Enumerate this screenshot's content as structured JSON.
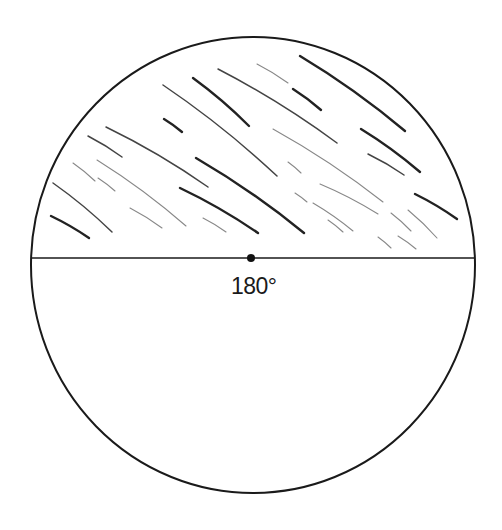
{
  "diagram": {
    "title": "",
    "angle_label": "180°",
    "colors": {
      "background": "#ffffff",
      "stroke": "#1a1a1a",
      "hatch_dark": "#222222",
      "hatch_mid": "#444444",
      "hatch_light": "#888888"
    },
    "circle": {
      "cx": 253,
      "cy": 265,
      "rx": 222,
      "ry": 228
    },
    "diameter": {
      "x1": 31,
      "x2": 474,
      "y": 258
    },
    "center_point": {
      "x": 251,
      "y": 258,
      "r": 4
    },
    "shaded_region": "upper semicircle (hatched)",
    "hatch_lines": [
      [
        300,
        56,
        405,
        131,
        "d"
      ],
      [
        257,
        64,
        288,
        83,
        "l"
      ],
      [
        293,
        89,
        321,
        110,
        "d"
      ],
      [
        218,
        69,
        337,
        143,
        "m"
      ],
      [
        193,
        78,
        249,
        126,
        "d"
      ],
      [
        163,
        85,
        277,
        176,
        "m"
      ],
      [
        164,
        119,
        182,
        132,
        "d"
      ],
      [
        273,
        129,
        383,
        202,
        "l"
      ],
      [
        361,
        129,
        420,
        172,
        "d"
      ],
      [
        368,
        154,
        404,
        175,
        "m"
      ],
      [
        106,
        127,
        208,
        187,
        "m"
      ],
      [
        88,
        136,
        122,
        157,
        "m"
      ],
      [
        73,
        163,
        95,
        181,
        "l"
      ],
      [
        97,
        160,
        186,
        226,
        "l"
      ],
      [
        98,
        178,
        115,
        191,
        "l"
      ],
      [
        53,
        183,
        112,
        232,
        "m"
      ],
      [
        51,
        216,
        89,
        238,
        "d"
      ],
      [
        130,
        208,
        162,
        228,
        "l"
      ],
      [
        180,
        188,
        258,
        233,
        "d"
      ],
      [
        196,
        158,
        304,
        233,
        "d"
      ],
      [
        203,
        218,
        226,
        232,
        "l"
      ],
      [
        288,
        162,
        301,
        173,
        "l"
      ],
      [
        320,
        184,
        378,
        214,
        "l"
      ],
      [
        295,
        193,
        307,
        202,
        "l"
      ],
      [
        313,
        203,
        353,
        231,
        "l"
      ],
      [
        328,
        220,
        343,
        232,
        "l"
      ],
      [
        415,
        194,
        457,
        219,
        "d"
      ],
      [
        391,
        213,
        411,
        231,
        "l"
      ],
      [
        408,
        210,
        437,
        238,
        "l"
      ],
      [
        378,
        237,
        391,
        248,
        "l"
      ],
      [
        398,
        236,
        416,
        249,
        "l"
      ]
    ]
  }
}
